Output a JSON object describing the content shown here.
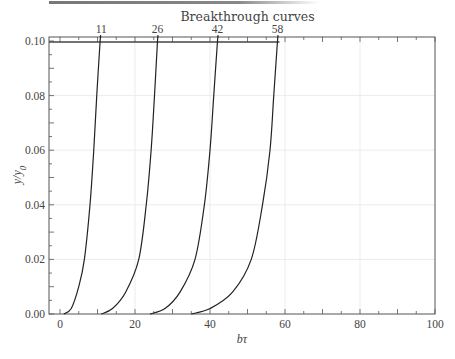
{
  "chart_data": {
    "type": "line",
    "title": "Breakthrough curves",
    "xlabel": "bτ",
    "ylabel": "y/y0",
    "xlim": [
      -3,
      100
    ],
    "ylim": [
      0,
      0.1
    ],
    "x_ticks": [
      0,
      20,
      40,
      60,
      80,
      100
    ],
    "x_tick_labels": [
      "0",
      "20",
      "40",
      "60",
      "80",
      "100"
    ],
    "y_ticks": [
      0.0,
      0.02,
      0.04,
      0.06,
      0.08,
      0.1
    ],
    "y_tick_labels": [
      "0.00",
      "0.02",
      "0.04",
      "0.06",
      "0.08",
      "0.10"
    ],
    "top_annotations": [
      "11",
      "26",
      "42",
      "58"
    ],
    "top_annotation_positions": [
      11,
      26,
      42,
      58
    ],
    "grid": true,
    "legend": "none",
    "reference_line": {
      "y": 0.1,
      "x_from": -3,
      "x_to": 58
    },
    "series": [
      {
        "name": "11",
        "x": [
          1,
          3,
          5,
          6.5,
          8,
          9,
          9.8,
          10.7
        ],
        "y": [
          0.0,
          0.002,
          0.01,
          0.02,
          0.04,
          0.06,
          0.08,
          0.1
        ]
      },
      {
        "name": "26",
        "x": [
          11,
          14,
          17.5,
          21,
          23,
          24.3,
          25.2,
          26
        ],
        "y": [
          0.0,
          0.002,
          0.008,
          0.02,
          0.04,
          0.06,
          0.08,
          0.1
        ]
      },
      {
        "name": "42",
        "x": [
          24,
          28,
          32,
          36,
          38.5,
          40,
          41,
          42
        ],
        "y": [
          0.0,
          0.002,
          0.008,
          0.02,
          0.04,
          0.06,
          0.08,
          0.1
        ]
      },
      {
        "name": "58",
        "x": [
          35,
          40,
          46,
          51,
          54,
          56,
          57,
          58
        ],
        "y": [
          0.0,
          0.002,
          0.008,
          0.02,
          0.04,
          0.06,
          0.08,
          0.1
        ]
      }
    ]
  }
}
